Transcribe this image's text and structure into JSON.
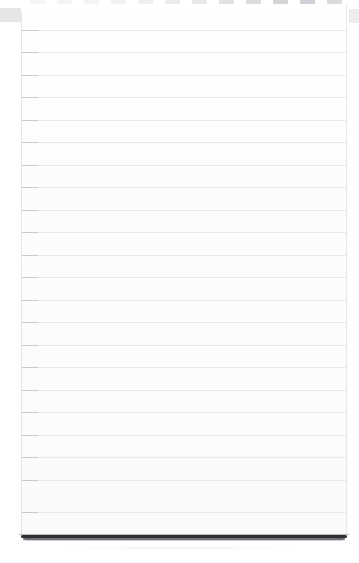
{
  "scene": {
    "width": 359,
    "height": 563,
    "background_color": "#ffffff",
    "subject": "ruled-notepad",
    "description": "Blank lined notepad page, photographed straight on"
  },
  "notepad": {
    "paper_color": "#fdfdfd",
    "left": 21,
    "top": 4,
    "width": 327,
    "height": 533,
    "page_edge_color": "#e9e9ec",
    "margin_line_color": "#e4e4e8"
  },
  "ruling": {
    "line_color": "#e8e9ed",
    "line_start_accent_color": "#c9cace",
    "spacing_px": 22.5,
    "first_line_y": 30,
    "count": 22,
    "line_y_positions": [
      30,
      52,
      75,
      97,
      120,
      142,
      165,
      187,
      210,
      232,
      255,
      277,
      300,
      322,
      345,
      367,
      390,
      412,
      435,
      457,
      480,
      512
    ]
  },
  "binding_tabs": {
    "color_light": "#f3f3f5",
    "color_mid": "#e7e7ea",
    "color_dark": "#d6d6da",
    "top": 0,
    "height": 4,
    "tabs": [
      {
        "x": 30,
        "color": "#f6f6f7"
      },
      {
        "x": 57,
        "color": "#f5f5f6"
      },
      {
        "x": 84,
        "color": "#f4f4f6"
      },
      {
        "x": 111,
        "color": "#f2f2f4"
      },
      {
        "x": 138,
        "color": "#efeff2"
      },
      {
        "x": 165,
        "color": "#ececef"
      },
      {
        "x": 192,
        "color": "#e8e8eb"
      },
      {
        "x": 219,
        "color": "#e2e2e6"
      },
      {
        "x": 246,
        "color": "#dbdbe0"
      },
      {
        "x": 273,
        "color": "#d4d4d9"
      },
      {
        "x": 300,
        "color": "#cfcfd5"
      },
      {
        "x": 327,
        "color": "#dadade"
      }
    ]
  },
  "corner_shadows": {
    "left": {
      "x": 0,
      "y": 8,
      "width": 21,
      "height": 14,
      "color": "#e6e6e9"
    },
    "right": {
      "x": 349,
      "y": 9,
      "width": 10,
      "height": 14,
      "color": "#ececef"
    }
  },
  "bottom_edge": {
    "y": 534,
    "dark_color": "#2f3033",
    "mid_color": "#6e7074",
    "soft_color": "#b9babd",
    "fade_color": "#cfd0d3"
  }
}
